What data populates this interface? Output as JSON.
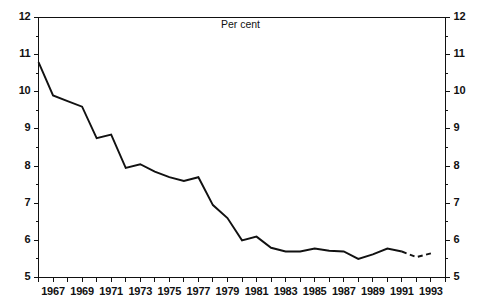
{
  "chart_data": {
    "type": "line",
    "title": "Per cent",
    "xlabel": "",
    "ylabel": "",
    "ylim": [
      5,
      12
    ],
    "xlim": [
      1966,
      1994
    ],
    "grid": false,
    "legend": "none",
    "ytick_labels": [
      "5",
      "6",
      "7",
      "8",
      "9",
      "10",
      "11",
      "12"
    ],
    "ytick_values": [
      5,
      6,
      7,
      8,
      9,
      10,
      11,
      12
    ],
    "yminor_step": 0.5,
    "xtick_values": [
      1966,
      1967,
      1968,
      1969,
      1970,
      1971,
      1972,
      1973,
      1974,
      1975,
      1976,
      1977,
      1978,
      1979,
      1980,
      1981,
      1982,
      1983,
      1984,
      1985,
      1986,
      1987,
      1988,
      1989,
      1990,
      1991,
      1992,
      1993,
      1994
    ],
    "xtick_labels": [
      "1967",
      "1969",
      "1971",
      "1973",
      "1975",
      "1977",
      "1979",
      "1981",
      "1983",
      "1985",
      "1987",
      "1989",
      "1991",
      "1993"
    ],
    "xtick_label_values": [
      1967,
      1969,
      1971,
      1973,
      1975,
      1977,
      1979,
      1981,
      1983,
      1985,
      1987,
      1989,
      1991,
      1993
    ],
    "axis_left_labels": [
      "12",
      "11",
      "10",
      "9",
      "8",
      "7",
      "6",
      "5"
    ],
    "axis_right_labels": [
      "12",
      "11",
      "10",
      "9",
      "8",
      "7",
      "6",
      "5"
    ],
    "series": [
      {
        "name": "Per cent",
        "style": "solid",
        "color": "#111111",
        "x": [
          1966,
          1967,
          1968,
          1969,
          1970,
          1971,
          1972,
          1973,
          1974,
          1975,
          1976,
          1977,
          1978,
          1979,
          1980,
          1981,
          1982,
          1983,
          1984,
          1985,
          1986,
          1987,
          1988,
          1989,
          1990,
          1991
        ],
        "values": [
          10.8,
          9.9,
          9.75,
          9.6,
          8.75,
          8.85,
          7.95,
          8.05,
          7.85,
          7.7,
          7.6,
          7.7,
          6.95,
          6.6,
          6.0,
          6.1,
          5.8,
          5.7,
          5.7,
          5.78,
          5.72,
          5.7,
          5.5,
          5.62,
          5.78,
          5.7
        ]
      },
      {
        "name": "Per cent (projected)",
        "style": "dashed",
        "color": "#111111",
        "x": [
          1991,
          1992,
          1993
        ],
        "values": [
          5.7,
          5.55,
          5.65
        ]
      }
    ]
  },
  "axis": {
    "top_label_left": "12",
    "top_label_right": "12"
  }
}
